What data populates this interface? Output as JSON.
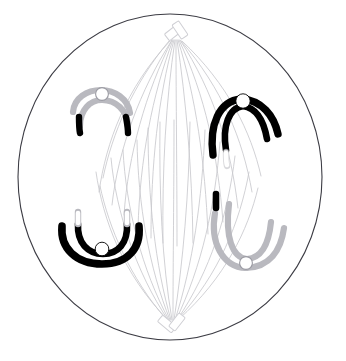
{
  "figure": {
    "caption": "",
    "background_color": "#ffffff"
  },
  "cell": {
    "label": "cell-membrane",
    "shape": "circle",
    "center_x": 170,
    "center_y": 177,
    "radius_x": 152,
    "radius_y": 163,
    "outline_color": "#3c3c44",
    "outline_width": 1.1,
    "fill_color": "#ffffff"
  },
  "poles": [
    {
      "name": "top-pole-centriole-pair",
      "position": "top",
      "x": 174,
      "y": 37,
      "outline_color": "#cfcfd4",
      "rod_count": 2
    },
    {
      "name": "bottom-pole-centriole-pair",
      "position": "bottom",
      "x": 170,
      "y": 322,
      "outline_color": "#cfcfd4",
      "rod_count": 2
    }
  ],
  "spindle": {
    "name": "spindle-apparatus",
    "fiber_color": "#c8c8cd",
    "fiber_width": 0.8,
    "fiber_count": 14,
    "description": "thin spindle fibers radiating between the two poles"
  },
  "chromosomes": [
    {
      "id": "upper-left",
      "name": "chromosome-upper-left",
      "shade": "light",
      "body_color": "#ffffff",
      "outline_color": "#b9b9bf",
      "tip_color": "#000000",
      "tips": 2,
      "centromere_color": "#ffffff",
      "centromere_outline": "#9a9aa2",
      "orientation": "arms-down",
      "center_x": 103,
      "center_y": 106
    },
    {
      "id": "upper-right",
      "name": "chromosome-upper-right",
      "shade": "dark",
      "body_color": "#000000",
      "outline_color": "#000000",
      "tip_color": "#ffffff",
      "tips": 1,
      "centromere_color": "#ffffff",
      "centromere_outline": "#000000",
      "orientation": "arms-down",
      "center_x": 243,
      "center_y": 104
    },
    {
      "id": "lower-left",
      "name": "chromosome-lower-left",
      "shade": "dark",
      "body_color": "#000000",
      "outline_color": "#000000",
      "tip_color": "#ffffff",
      "tips": 2,
      "centromere_color": "#ffffff",
      "centromere_outline": "#000000",
      "orientation": "arms-up",
      "center_x": 103,
      "center_y": 247
    },
    {
      "id": "lower-right",
      "name": "chromosome-lower-right",
      "shade": "light",
      "body_color": "#ffffff",
      "outline_color": "#b9b9bf",
      "tip_color": "#000000",
      "tips": 1,
      "centromere_color": "#ffffff",
      "centromere_outline": "#9a9aa2",
      "orientation": "arms-up",
      "center_x": 247,
      "center_y": 256
    }
  ],
  "colors": {
    "membrane": "#3c3c44",
    "spindle_fiber": "#c8c8cd",
    "chromatid_dark": "#000000",
    "chromatid_light_outline": "#b9b9bf",
    "centromere_fill": "#ffffff"
  }
}
